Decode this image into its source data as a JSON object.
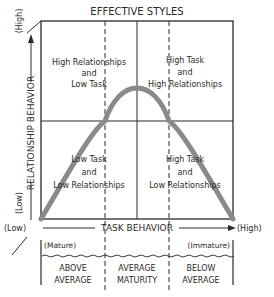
{
  "title": "EFFECTIVE STYLES",
  "y_axis": {
    "label": "RELATIONSHIP BEHAVIOR",
    "high": "(High)",
    "low": "(Low)"
  },
  "x_axis": {
    "label": "TASK BEHAVIOR",
    "low": "(Low)",
    "high": "(High)"
  },
  "quadrants": [
    {
      "position": "top-left",
      "lines": [
        "High Relationships",
        "and",
        "Low Task"
      ]
    },
    {
      "position": "top-right",
      "lines": [
        "High Task",
        "and",
        "High Relationships"
      ]
    },
    {
      "position": "bottom-left",
      "lines": [
        "Low Task",
        "and",
        "Low Relationships"
      ]
    },
    {
      "position": "bottom-right",
      "lines": [
        "High Task",
        "and",
        "Low Relationships"
      ]
    }
  ],
  "maturity": {
    "left_end": "(Mature)",
    "right_end": "(Immature)",
    "bands": [
      {
        "lines": [
          "ABOVE",
          "AVERAGE"
        ]
      },
      {
        "lines": [
          "AVERAGE",
          "MATURITY"
        ]
      },
      {
        "lines": [
          "BELOW",
          "AVERAGE"
        ]
      }
    ]
  },
  "colors": {
    "line": "#2a2a2a",
    "curve": "#8a8a8a",
    "background": "#ffffff"
  }
}
